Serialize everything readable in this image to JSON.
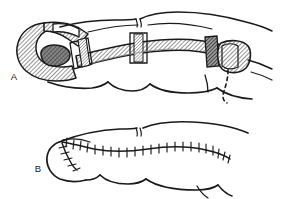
{
  "figure": {
    "background_color": "#ffffff",
    "ink_color": "#1a1a1a",
    "hatch_fill_color": "#8c8c8c",
    "dark_fill_color": "#4d4d4d",
    "width": 281,
    "height": 199,
    "view": "lateral view of index finger, two-stage sequence"
  },
  "panels": [
    {
      "id": "panel-a",
      "label": "A",
      "label_x": 14,
      "label_y": 80,
      "caption": "Flap elevated and inset over fingertip defect; donor site marked",
      "elements": {
        "flap_hatched": "raised pedicle flap, hatched shading",
        "defect_dark": "exposed fingertip defect, dark shading",
        "donor_block_hatched": "donor site on adjacent digit, hatched",
        "dashed_outline": "planned incision line, dashed",
        "joint_creases": "interphalangeal joint skin creases"
      }
    },
    {
      "id": "panel-b",
      "label": "B",
      "label_x": 38,
      "label_y": 170,
      "caption": "Final closure with interrupted sutures along flap margin",
      "elements": {
        "suture_line": "primary suture line with interrupted stitch marks",
        "suture_count": 24,
        "branch_suture_line": "short secondary suture limb at fingertip",
        "joint_creases": "interphalangeal joint skin creases"
      }
    }
  ],
  "legend": {
    "hatched_meaning": "flap / donor tissue",
    "dark_meaning": "soft-tissue defect",
    "dashed_meaning": "planned incision",
    "ticks_meaning": "interrupted sutures"
  }
}
